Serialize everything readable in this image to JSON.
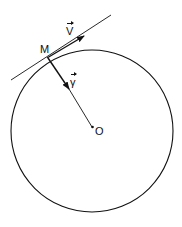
{
  "diagram": {
    "labels": {
      "point": "M",
      "velocity": "V",
      "acceleration": "γ",
      "center": "O"
    },
    "elements": {
      "circle": {
        "cx": 92,
        "cy": 131,
        "r": 81
      },
      "tangent_line": {
        "from": [
          11,
          80
        ],
        "to": [
          111,
          15
        ]
      },
      "velocity_arrow": {
        "from": [
          47,
          58
        ],
        "to": [
          84,
          36
        ]
      },
      "acceleration_arrow": {
        "from": [
          48,
          58
        ],
        "to": [
          69,
          89
        ]
      },
      "radius_line": {
        "from": [
          69,
          89
        ],
        "to": [
          91,
          126
        ]
      }
    },
    "colors": {
      "stroke": "#111111",
      "background": "#ffffff"
    }
  }
}
